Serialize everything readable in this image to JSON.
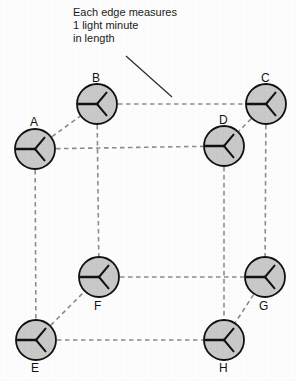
{
  "figure": {
    "background_color": "#fdfdfd",
    "annotation": {
      "lines": [
        "Each edge measures",
        "1 light minute",
        "in length"
      ],
      "full_text": "Each edge measures 1 light minute in length",
      "leader_line": {
        "style": "solid",
        "color": "#2b2b2b",
        "from": [
          126,
          56
        ],
        "to": [
          172,
          97
        ]
      }
    },
    "style": {
      "edge_style": "dashed",
      "edge_color": "#8d8d8d",
      "node_fill": "#c9c9c9",
      "node_stroke": "#111111",
      "hand_color": "#111111",
      "label_color": "#121212"
    },
    "nodes": [
      {
        "id": "A",
        "label": "A",
        "cx": 35,
        "cy": 149,
        "r": 20,
        "label_x": 30,
        "label_y": 116,
        "label_pos": "above"
      },
      {
        "id": "B",
        "label": "B",
        "cx": 97,
        "cy": 104,
        "r": 20,
        "label_x": 92,
        "label_y": 72,
        "label_pos": "above"
      },
      {
        "id": "C",
        "label": "C",
        "cx": 266,
        "cy": 104,
        "r": 20,
        "label_x": 261,
        "label_y": 72,
        "label_pos": "above"
      },
      {
        "id": "D",
        "label": "D",
        "cx": 224,
        "cy": 146,
        "r": 20,
        "label_x": 219,
        "label_y": 114,
        "label_pos": "above"
      },
      {
        "id": "E",
        "label": "E",
        "cx": 36,
        "cy": 340,
        "r": 20,
        "label_x": 31,
        "label_y": 362,
        "label_pos": "below"
      },
      {
        "id": "F",
        "label": "F",
        "cx": 99,
        "cy": 277,
        "r": 20,
        "label_x": 94,
        "label_y": 300,
        "label_pos": "below"
      },
      {
        "id": "G",
        "label": "G",
        "cx": 265,
        "cy": 277,
        "r": 20,
        "label_x": 259,
        "label_y": 300,
        "label_pos": "below"
      },
      {
        "id": "H",
        "label": "H",
        "cx": 224,
        "cy": 340,
        "r": 20,
        "label_x": 219,
        "label_y": 362,
        "label_pos": "below"
      }
    ],
    "edges": [
      {
        "from": "A",
        "to": "B",
        "orientation": "diagonal"
      },
      {
        "from": "B",
        "to": "C",
        "orientation": "horizontal"
      },
      {
        "from": "C",
        "to": "D",
        "orientation": "diagonal"
      },
      {
        "from": "A",
        "to": "D",
        "orientation": "horizontal"
      },
      {
        "from": "A",
        "to": "E",
        "orientation": "vertical"
      },
      {
        "from": "B",
        "to": "F",
        "orientation": "vertical"
      },
      {
        "from": "C",
        "to": "G",
        "orientation": "vertical"
      },
      {
        "from": "D",
        "to": "H",
        "orientation": "vertical"
      },
      {
        "from": "E",
        "to": "F",
        "orientation": "diagonal"
      },
      {
        "from": "F",
        "to": "G",
        "orientation": "horizontal"
      },
      {
        "from": "G",
        "to": "H",
        "orientation": "diagonal"
      },
      {
        "from": "E",
        "to": "H",
        "orientation": "horizontal"
      }
    ],
    "clock_hands": {
      "description": "Each clock shows three hands radiating from the centre",
      "angles_deg": [
        180,
        310,
        50
      ]
    }
  }
}
